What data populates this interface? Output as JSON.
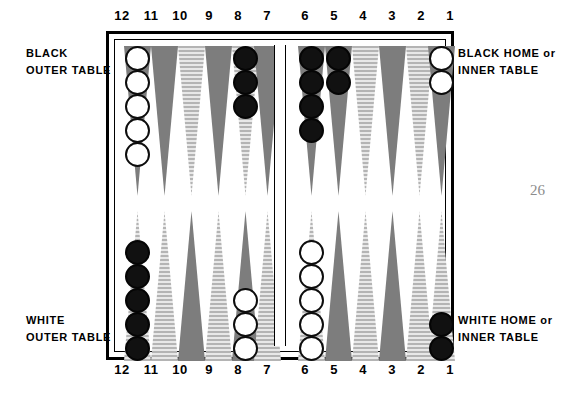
{
  "figure": {
    "page_number": "26",
    "top_point_numbers": [
      "12",
      "11",
      "10",
      "9",
      "8",
      "7",
      "6",
      "5",
      "4",
      "3",
      "2",
      "1"
    ],
    "bottom_point_numbers": [
      "12",
      "11",
      "10",
      "9",
      "8",
      "7",
      "6",
      "5",
      "4",
      "3",
      "2",
      "1"
    ]
  },
  "captions": {
    "top_left": {
      "line1": "BLACK",
      "line2": "OUTER TABLE"
    },
    "top_right": {
      "line1": "BLACK HOME or",
      "line2": "INNER TABLE"
    },
    "bottom_left": {
      "line1": "WHITE",
      "line2": "OUTER TABLE"
    },
    "bottom_right": {
      "line1": "WHITE HOME or",
      "line2": "INNER TABLE"
    }
  },
  "colors": {
    "checker_black": "#111111",
    "checker_white": "#ffffff",
    "point_dark": "#808080",
    "point_light": "#d0d0d0",
    "frame": "#000000",
    "page_number": "#8c8c8c"
  },
  "chart_data": {
    "type": "table",
    "quadrants": [
      {
        "name": "black-outer-table",
        "position": "top-left",
        "points": [
          "12",
          "11",
          "10",
          "9",
          "8",
          "7"
        ]
      },
      {
        "name": "black-home-inner-table",
        "position": "top-right",
        "points": [
          "6",
          "5",
          "4",
          "3",
          "2",
          "1"
        ]
      },
      {
        "name": "white-outer-table",
        "position": "bottom-left",
        "points": [
          "12",
          "11",
          "10",
          "9",
          "8",
          "7"
        ]
      },
      {
        "name": "white-home-inner-table",
        "position": "bottom-right",
        "points": [
          "6",
          "5",
          "4",
          "3",
          "2",
          "1"
        ]
      }
    ],
    "points": [
      {
        "point": "12",
        "row": "top",
        "fill": "dark",
        "checkers": 5,
        "color": "white"
      },
      {
        "point": "11",
        "row": "top",
        "fill": "dark",
        "checkers": 0,
        "color": null
      },
      {
        "point": "10",
        "row": "top",
        "fill": "light",
        "checkers": 0,
        "color": null
      },
      {
        "point": "9",
        "row": "top",
        "fill": "dark",
        "checkers": 0,
        "color": null
      },
      {
        "point": "8",
        "row": "top",
        "fill": "light",
        "checkers": 3,
        "color": "black"
      },
      {
        "point": "7",
        "row": "top",
        "fill": "dark",
        "checkers": 0,
        "color": null
      },
      {
        "point": "6",
        "row": "top",
        "fill": "dark",
        "checkers": 4,
        "color": "black"
      },
      {
        "point": "5",
        "row": "top",
        "fill": "dark",
        "checkers": 2,
        "color": "black"
      },
      {
        "point": "4",
        "row": "top",
        "fill": "light",
        "checkers": 0,
        "color": null
      },
      {
        "point": "3",
        "row": "top",
        "fill": "dark",
        "checkers": 0,
        "color": null
      },
      {
        "point": "2",
        "row": "top",
        "fill": "light",
        "checkers": 0,
        "color": null
      },
      {
        "point": "1",
        "row": "top",
        "fill": "dark",
        "checkers": 2,
        "color": "white"
      },
      {
        "point": "12",
        "row": "bottom",
        "fill": "light",
        "checkers": 5,
        "color": "black"
      },
      {
        "point": "11",
        "row": "bottom",
        "fill": "light",
        "checkers": 0,
        "color": null
      },
      {
        "point": "10",
        "row": "bottom",
        "fill": "dark",
        "checkers": 0,
        "color": null
      },
      {
        "point": "9",
        "row": "bottom",
        "fill": "light",
        "checkers": 0,
        "color": null
      },
      {
        "point": "8",
        "row": "bottom",
        "fill": "dark",
        "checkers": 3,
        "color": "white"
      },
      {
        "point": "7",
        "row": "bottom",
        "fill": "light",
        "checkers": 0,
        "color": null
      },
      {
        "point": "6",
        "row": "bottom",
        "fill": "light",
        "checkers": 5,
        "color": "white"
      },
      {
        "point": "5",
        "row": "bottom",
        "fill": "dark",
        "checkers": 0,
        "color": null
      },
      {
        "point": "4",
        "row": "bottom",
        "fill": "light",
        "checkers": 0,
        "color": null
      },
      {
        "point": "3",
        "row": "bottom",
        "fill": "dark",
        "checkers": 0,
        "color": null
      },
      {
        "point": "2",
        "row": "bottom",
        "fill": "light",
        "checkers": 0,
        "color": null
      },
      {
        "point": "1",
        "row": "bottom",
        "fill": "light",
        "checkers": 2,
        "color": "black"
      }
    ]
  }
}
